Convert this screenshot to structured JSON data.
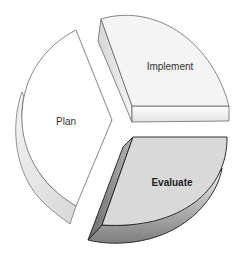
{
  "diagram": {
    "type": "cycle-pie-3d",
    "segments": [
      {
        "id": "plan",
        "label": "Plan",
        "fill": "#ffffff",
        "side_fill": "#e6e6e6",
        "emphasis": false
      },
      {
        "id": "implement",
        "label": "Implement",
        "fill": "#f4f4f4",
        "side_fill": "#dcdcdc",
        "emphasis": false
      },
      {
        "id": "evaluate",
        "label": "Evaluate",
        "fill": "#d9d9d9",
        "side_fill": "#8a8a8a",
        "emphasis": true
      }
    ],
    "colors": {
      "outline": "#555555",
      "evaluate_outline": "#1e1e1e",
      "background": "#ffffff"
    }
  }
}
